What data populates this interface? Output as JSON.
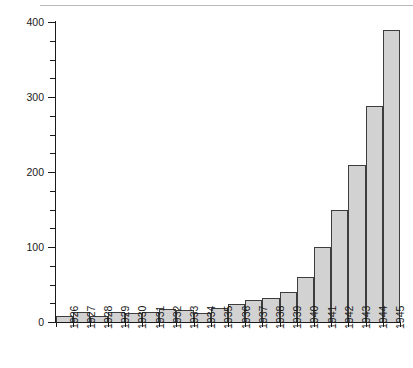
{
  "chart_data": {
    "type": "bar",
    "title": "",
    "subtitle": "",
    "xlabel": "",
    "ylabel": "",
    "categories": [
      "1926",
      "1927",
      "1928",
      "1929",
      "1930",
      "1931",
      "1932",
      "1933",
      "1934",
      "1935",
      "1936",
      "1937",
      "1938",
      "1939",
      "1940",
      "1941",
      "1942",
      "1943",
      "1944",
      "1945"
    ],
    "values": [
      8,
      13,
      8,
      14,
      12,
      13,
      17,
      16,
      12,
      19,
      24,
      30,
      32,
      40,
      60,
      100,
      150,
      210,
      288,
      390
    ],
    "ylim": [
      0,
      400
    ],
    "yticks": [
      0,
      100,
      200,
      300,
      400
    ],
    "ytick_labels": [
      "0",
      "100",
      "200",
      "300",
      "400"
    ],
    "yminor_interval": 25,
    "grid": false,
    "legend": null,
    "bar_fill": "#d2d2d2",
    "bar_edge": "#3d3d3d",
    "axis_color": "#1a1a1a",
    "background": "#ffffff"
  },
  "figure": {
    "top_rule_visible": true
  }
}
